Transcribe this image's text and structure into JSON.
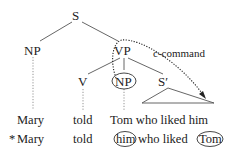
{
  "diagram": {
    "type": "syntax-tree",
    "nodes": {
      "root": "S",
      "subject": "NP",
      "predicate": "VP",
      "verb": "V",
      "object": "NP",
      "relative_clause": "S′"
    },
    "annotation": "c-command",
    "sentences": [
      {
        "marker": "",
        "words": [
          "Mary",
          "told",
          "Tom who liked him"
        ]
      },
      {
        "marker": "*",
        "words": [
          "Mary",
          "told",
          "him",
          "who liked",
          "Tom"
        ],
        "circled": [
          "him",
          "Tom"
        ]
      }
    ],
    "colors": {
      "ink": "#222222",
      "line": "#555555",
      "background": "#ffffff"
    }
  }
}
